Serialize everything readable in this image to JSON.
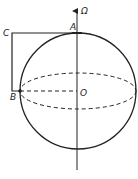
{
  "diagram": {
    "labels": {
      "omega": "Ω",
      "A": "A",
      "B": "B",
      "C": "C",
      "O": "O"
    },
    "colors": {
      "line": "#222222",
      "background": "#ffffff"
    },
    "geometry": {
      "sphere_center": [
        78,
        91
      ],
      "sphere_radius": 58,
      "equator_ry": 18,
      "axis_x": 77,
      "axis_top": 10,
      "axis_bottom": 170,
      "rect_corners": {
        "A": [
          77,
          33
        ],
        "C": [
          12,
          33
        ],
        "B": [
          20,
          91
        ]
      }
    }
  }
}
